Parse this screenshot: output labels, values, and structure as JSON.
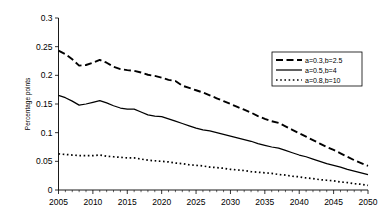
{
  "chart_data": {
    "type": "line",
    "title": "",
    "xlabel": "",
    "ylabel": "Percentage points",
    "xlim": [
      2005,
      2050
    ],
    "ylim": [
      0,
      0.3
    ],
    "grid": false,
    "legend_position": "top-right",
    "x_ticks": [
      "2005",
      "2010",
      "2015",
      "2020",
      "2025",
      "2030",
      "2035",
      "2040",
      "2045",
      "2050"
    ],
    "y_ticks": [
      "0",
      "0.05",
      "0.1",
      "0.15",
      "0.2",
      "0.25",
      "0.3"
    ],
    "x": [
      2005,
      2006,
      2007,
      2008,
      2009,
      2010,
      2011,
      2012,
      2013,
      2014,
      2015,
      2016,
      2017,
      2018,
      2019,
      2020,
      2021,
      2022,
      2023,
      2024,
      2025,
      2026,
      2027,
      2028,
      2029,
      2030,
      2031,
      2032,
      2033,
      2034,
      2035,
      2036,
      2037,
      2038,
      2039,
      2040,
      2041,
      2042,
      2043,
      2044,
      2045,
      2046,
      2047,
      2048,
      2049,
      2050
    ],
    "series": [
      {
        "name": "a=0.3,b=2.5",
        "style": "dashed",
        "values": [
          0.243,
          0.237,
          0.228,
          0.217,
          0.218,
          0.222,
          0.227,
          0.222,
          0.215,
          0.211,
          0.209,
          0.208,
          0.205,
          0.201,
          0.199,
          0.196,
          0.192,
          0.19,
          0.182,
          0.178,
          0.174,
          0.17,
          0.165,
          0.16,
          0.155,
          0.15,
          0.145,
          0.14,
          0.135,
          0.129,
          0.124,
          0.12,
          0.117,
          0.111,
          0.105,
          0.099,
          0.093,
          0.087,
          0.081,
          0.075,
          0.07,
          0.064,
          0.058,
          0.052,
          0.047,
          0.042
        ]
      },
      {
        "name": "a=0.5,b=4",
        "style": "solid",
        "values": [
          0.165,
          0.161,
          0.155,
          0.148,
          0.15,
          0.153,
          0.156,
          0.152,
          0.147,
          0.143,
          0.141,
          0.141,
          0.136,
          0.131,
          0.129,
          0.128,
          0.124,
          0.12,
          0.116,
          0.112,
          0.108,
          0.105,
          0.103,
          0.1,
          0.097,
          0.094,
          0.091,
          0.088,
          0.085,
          0.081,
          0.078,
          0.075,
          0.073,
          0.069,
          0.065,
          0.061,
          0.058,
          0.054,
          0.05,
          0.046,
          0.043,
          0.04,
          0.036,
          0.033,
          0.03,
          0.027
        ]
      },
      {
        "name": "a=0.8,b=10",
        "style": "dotted",
        "values": [
          0.063,
          0.062,
          0.061,
          0.06,
          0.06,
          0.06,
          0.061,
          0.059,
          0.058,
          0.057,
          0.056,
          0.056,
          0.054,
          0.052,
          0.051,
          0.05,
          0.049,
          0.047,
          0.046,
          0.044,
          0.043,
          0.042,
          0.04,
          0.039,
          0.038,
          0.036,
          0.035,
          0.034,
          0.032,
          0.031,
          0.03,
          0.029,
          0.027,
          0.026,
          0.024,
          0.023,
          0.021,
          0.02,
          0.018,
          0.017,
          0.016,
          0.014,
          0.013,
          0.011,
          0.01,
          0.008
        ]
      }
    ]
  }
}
